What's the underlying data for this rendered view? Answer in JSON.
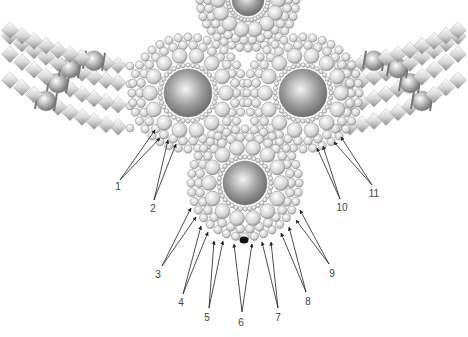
{
  "diagram": {
    "type": "beadwork-pattern",
    "components": {
      "rosettes": [
        {
          "id": "top-center-partial",
          "cx": 248,
          "cy": 0,
          "r": 52
        },
        {
          "id": "upper-left",
          "cx": 188,
          "cy": 93,
          "r": 60
        },
        {
          "id": "upper-right",
          "cx": 303,
          "cy": 93,
          "r": 60
        },
        {
          "id": "bottom-center",
          "cx": 245,
          "cy": 183,
          "r": 58
        }
      ],
      "strands_left": 4,
      "strands_right": 4
    },
    "labels": [
      {
        "text": "1",
        "x": 118,
        "y": 186
      },
      {
        "text": "2",
        "x": 153,
        "y": 208
      },
      {
        "text": "3",
        "x": 158,
        "y": 274
      },
      {
        "text": "4",
        "x": 181,
        "y": 302
      },
      {
        "text": "5",
        "x": 207,
        "y": 317
      },
      {
        "text": "6",
        "x": 241,
        "y": 322
      },
      {
        "text": "7",
        "x": 278,
        "y": 317
      },
      {
        "text": "8",
        "x": 308,
        "y": 301
      },
      {
        "text": "9",
        "x": 332,
        "y": 273
      },
      {
        "text": "10",
        "x": 342,
        "y": 207
      },
      {
        "text": "11",
        "x": 374,
        "y": 193
      }
    ],
    "arrows": [
      {
        "label": "1",
        "from": [
          120,
          180
        ],
        "to": [
          155,
          130
        ]
      },
      {
        "label": "1",
        "from": [
          120,
          180
        ],
        "to": [
          160,
          138
        ]
      },
      {
        "label": "2",
        "from": [
          154,
          200
        ],
        "to": [
          168,
          140
        ]
      },
      {
        "label": "2",
        "from": [
          154,
          200
        ],
        "to": [
          176,
          144
        ]
      },
      {
        "label": "3",
        "from": [
          162,
          266
        ],
        "to": [
          191,
          208
        ]
      },
      {
        "label": "3",
        "from": [
          162,
          266
        ],
        "to": [
          196,
          217
        ]
      },
      {
        "label": "4",
        "from": [
          183,
          294
        ],
        "to": [
          201,
          226
        ]
      },
      {
        "label": "4",
        "from": [
          183,
          294
        ],
        "to": [
          208,
          232
        ]
      },
      {
        "label": "5",
        "from": [
          209,
          308
        ],
        "to": [
          214,
          241
        ]
      },
      {
        "label": "5",
        "from": [
          209,
          308
        ],
        "to": [
          223,
          241
        ]
      },
      {
        "label": "6",
        "from": [
          242,
          312
        ],
        "to": [
          234,
          244
        ]
      },
      {
        "label": "6",
        "from": [
          242,
          312
        ],
        "to": [
          252,
          244
        ]
      },
      {
        "label": "7",
        "from": [
          278,
          308
        ],
        "to": [
          262,
          242
        ]
      },
      {
        "label": "7",
        "from": [
          278,
          308
        ],
        "to": [
          271,
          242
        ]
      },
      {
        "label": "8",
        "from": [
          306,
          292
        ],
        "to": [
          281,
          233
        ]
      },
      {
        "label": "8",
        "from": [
          306,
          292
        ],
        "to": [
          289,
          227
        ]
      },
      {
        "label": "9",
        "from": [
          329,
          264
        ],
        "to": [
          296,
          220
        ]
      },
      {
        "label": "9",
        "from": [
          329,
          264
        ],
        "to": [
          300,
          210
        ]
      },
      {
        "label": "10",
        "from": [
          340,
          199
        ],
        "to": [
          317,
          148
        ]
      },
      {
        "label": "10",
        "from": [
          340,
          199
        ],
        "to": [
          323,
          146
        ]
      },
      {
        "label": "11",
        "from": [
          372,
          185
        ],
        "to": [
          334,
          142
        ]
      },
      {
        "label": "11",
        "from": [
          372,
          185
        ],
        "to": [
          341,
          137
        ]
      }
    ],
    "highlight_bead": {
      "x": 244,
      "y": 240,
      "color": "#111111"
    }
  }
}
